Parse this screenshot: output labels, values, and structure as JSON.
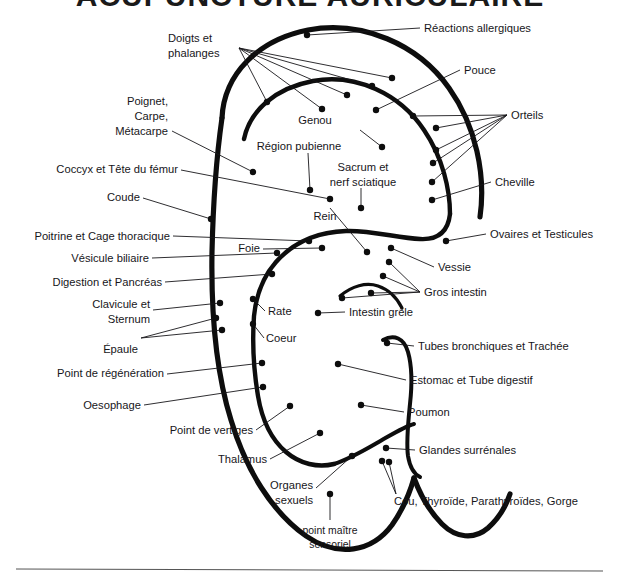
{
  "document": {
    "title": "ACUPUNCTURE AURICULAIRE",
    "title_visible_fragment": "ACUPUNCTURE AURIC",
    "language": "fr",
    "kind": "auricular-acupuncture-chart",
    "ink_color": "#0d0d0d",
    "paper_color": "#ffffff"
  },
  "labels": {
    "doigts_et_phalanges_l1": "Doigts et",
    "doigts_et_phalanges_l2": "phalanges",
    "poignet_l1": "Poignet,",
    "poignet_l2": "Carpe,",
    "poignet_l3": "Métacarpe",
    "coccyx": "Coccyx et Tête du fémur",
    "coude": "Coude",
    "poitrine": "Poitrine et Cage thoracique",
    "vesicule": "Vésicule biliaire",
    "digestion": "Digestion et Pancréas",
    "clavicule_l1": "Clavicule et",
    "clavicule_l2": "Sternum",
    "epaule": "Épaule",
    "regeneration": "Point de régénération",
    "oesophage": "Oesophage",
    "vertiges": "Point de vertiges",
    "thalamus": "Thalamus",
    "organes_l1": "Organes",
    "organes_l2": "sexuels",
    "maitre_l1": "point maître",
    "maitre_l2": "sensoriel",
    "reactions": "Réactions allergiques",
    "pouce": "Pouce",
    "orteils": "Orteils",
    "cheville": "Cheville",
    "ovaires": "Ovaires et Testicules",
    "vessie": "Vessie",
    "gros_intestin": "Gros intestin",
    "tubes": "Tubes bronchiques et Trachée",
    "estomac": "Estomac et Tube digestif",
    "poumon": "Poumon",
    "glandes": "Glandes surrénales",
    "cou": "Cou, Thyroïde, Parathyroïdes, Gorge",
    "genou": "Genou",
    "region_pubienne": "Région pubienne",
    "sacrum_l1": "Sacrum et",
    "sacrum_l2": "nerf sciatique",
    "rein": "Rein",
    "foie": "Foie",
    "rate": "Rate",
    "coeur": "Coeur",
    "intestin_grele": "Intestin grêle"
  },
  "points": {
    "count": 38,
    "note": "Black filled circles marking acupuncture points on the auricle"
  }
}
